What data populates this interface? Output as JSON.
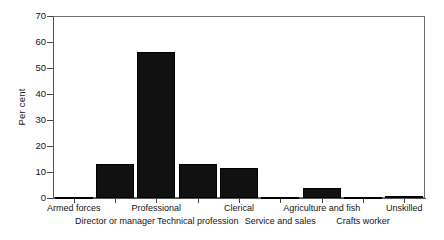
{
  "chart_data": {
    "type": "bar",
    "title": "",
    "subtitle": "",
    "xlabel": "",
    "ylabel": "Per cent",
    "ylim": [
      0,
      70
    ],
    "yticks": [
      0,
      10,
      20,
      30,
      40,
      50,
      60,
      70
    ],
    "grid": false,
    "legend": false,
    "bar_color": "#111111",
    "categories": [
      "Armed forces",
      "Director or manager",
      "Professional",
      "Technical profession",
      "Clerical",
      "Service and sales",
      "Agriculture and fish",
      "Crafts worker",
      "Unskilled"
    ],
    "values": [
      0.2,
      13.1,
      56.2,
      13.1,
      11.5,
      0.3,
      3.8,
      0.3,
      0.8
    ],
    "category_label_rows": [
      0,
      1,
      0,
      1,
      0,
      1,
      0,
      1,
      0
    ],
    "axis_color": "#555555",
    "frame_color": "#6e6e6e"
  },
  "yticklabels": {
    "t0": "0",
    "t1": "10",
    "t2": "20",
    "t3": "30",
    "t4": "40",
    "t5": "50",
    "t6": "60",
    "t7": "70"
  },
  "categories_text": {
    "c0": "Armed forces",
    "c1": "Director or manager",
    "c2": "Professional",
    "c3": "Technical profession",
    "c4": "Clerical",
    "c5": "Service and sales",
    "c6": "Agriculture and fish",
    "c7": "Crafts worker",
    "c8": "Unskilled"
  },
  "axis": {
    "y_title": "Per cent"
  }
}
